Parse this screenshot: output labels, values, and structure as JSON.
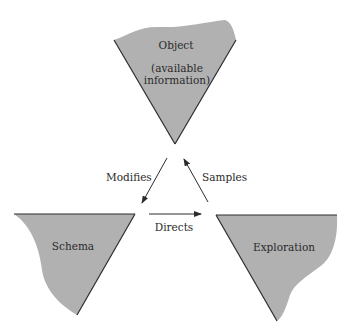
{
  "diagram": {
    "type": "perceptual-cycle",
    "colors": {
      "fill": "#b1b1b1",
      "stroke": "#2c2c2c",
      "text": "#2a2a2a",
      "background": "#ffffff"
    },
    "nodes": {
      "object": {
        "title": "Object",
        "subtitle_line1": "(available",
        "subtitle_line2": "information)"
      },
      "schema": {
        "title": "Schema"
      },
      "exploration": {
        "title": "Exploration"
      }
    },
    "edges": {
      "modifies": {
        "label": "Modifies",
        "from": "object",
        "to": "schema"
      },
      "directs": {
        "label": "Directs",
        "from": "schema",
        "to": "exploration"
      },
      "samples": {
        "label": "Samples",
        "from": "exploration",
        "to": "object"
      }
    }
  }
}
